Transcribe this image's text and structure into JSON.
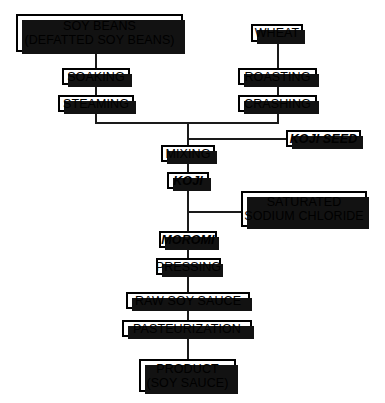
{
  "diagram": {
    "colors": {
      "box_border": "#000000",
      "box_fill": "#ffffff",
      "shadow": "#121212",
      "line": "#1a1a1a",
      "text": "#000000"
    },
    "nodes": {
      "soy_beans": {
        "line1": "SOY BEANS",
        "line2": "(DEFATTED SOY BEANS)"
      },
      "soaking": {
        "label": "SOAKING"
      },
      "steaming": {
        "label": "STEAMING"
      },
      "wheat": {
        "label": "WHEAT"
      },
      "roasting": {
        "label": "ROASTING"
      },
      "crashing": {
        "label": "CRASHING"
      },
      "koji_seed": {
        "label": "KOJI SEED"
      },
      "mixing": {
        "label": "MIXING"
      },
      "koji": {
        "label": "KOJI"
      },
      "saturated_sodium_chloride": {
        "line1": "SATURATED",
        "line2": "SODIUM CHLORIDE"
      },
      "moromi": {
        "label": "MOROMI"
      },
      "pressing": {
        "label": "PRESSING"
      },
      "raw_soy_sauce": {
        "label": "RAW SOY SAUCE"
      },
      "pasteurization": {
        "label": "PASTEURIZATION"
      },
      "product": {
        "line1": "PRODUCT",
        "line2": "(SOY SAUCE)"
      }
    }
  }
}
